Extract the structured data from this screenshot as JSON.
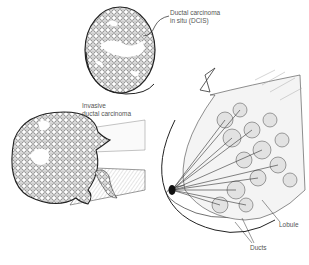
{
  "diagram": {
    "labels": {
      "dcis": [
        "Ductal carcinoma",
        "in situ (DCIS)"
      ],
      "idc": [
        "Invasive",
        "ductal carcinoma"
      ],
      "lobule": "Lobule",
      "ducts": "Ducts"
    },
    "colors": {
      "ink": "#222222",
      "label_text": "#555555",
      "background": "#ffffff"
    }
  }
}
